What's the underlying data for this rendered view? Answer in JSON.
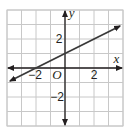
{
  "chart_data": {
    "type": "line",
    "title": "",
    "xlabel": "x",
    "ylabel": "y",
    "origin_label": "O",
    "xlim": [
      -4,
      4
    ],
    "ylim": [
      -4,
      4
    ],
    "grid": true,
    "x_tick_labels": [
      {
        "value": -2,
        "label": "−2"
      },
      {
        "value": 2,
        "label": "2"
      }
    ],
    "y_tick_labels": [
      {
        "value": 2,
        "label": "2"
      },
      {
        "value": -2,
        "label": "−2"
      }
    ],
    "series": [
      {
        "name": "line",
        "equation": "y = 0.5x + 1",
        "x": [
          -3.8,
          -2,
          0,
          2,
          3.8
        ],
        "y": [
          -0.9,
          0,
          1,
          2,
          2.9
        ],
        "arrows_both_ends": true,
        "color": "#3a3a3a"
      }
    ],
    "colors": {
      "grid": "#c8c8c8",
      "axis": "#231f20",
      "line": "#3a3a3a",
      "background": "#ffffff"
    }
  }
}
